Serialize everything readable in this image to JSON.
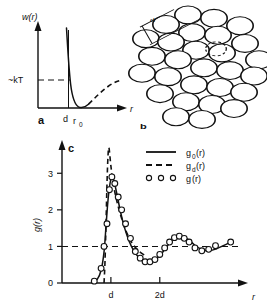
{
  "figure": {
    "background_color": "#ffffff",
    "ink_color": "#111111"
  },
  "panel_a": {
    "letter": "a",
    "ylabel": "w(r)",
    "xlabel": "r",
    "energy_label": "~kT",
    "tick_d": "d",
    "tick_r0": "r",
    "tick_r0_sub": "0",
    "chart_data": {
      "type": "line",
      "title": "Pair potential w(r)",
      "xlabel": "r",
      "ylabel": "w(r)",
      "xlim": [
        0,
        1
      ],
      "ylim": [
        -0.35,
        1.0
      ],
      "grid": false,
      "legend_position": "none",
      "annotations": [
        {
          "text": "~kT",
          "x": 0.0,
          "y": 0.0,
          "note": "thermal energy reference level, dashed guide"
        },
        {
          "text": "d",
          "x": 0.42,
          "y": -0.35,
          "note": "hard core diameter on r axis"
        },
        {
          "text": "r0",
          "x": 0.5,
          "y": -0.35,
          "note": "potential minimum position"
        }
      ],
      "series": [
        {
          "name": "repulsive core and well (solid)",
          "style": "solid",
          "x": [
            0.4,
            0.402,
            0.408,
            0.415,
            0.425,
            0.44,
            0.46,
            0.48,
            0.5,
            0.52,
            0.545
          ],
          "y": [
            1.0,
            0.8,
            0.55,
            0.36,
            0.2,
            0.06,
            -0.06,
            -0.13,
            -0.155,
            -0.15,
            -0.12
          ]
        },
        {
          "name": "attractive tail (dashed)",
          "style": "dashed",
          "x": [
            0.545,
            0.6,
            0.66,
            0.72,
            0.79,
            0.86,
            0.93
          ],
          "y": [
            -0.12,
            -0.065,
            -0.03,
            -0.008,
            0.006,
            0.015,
            0.02
          ]
        }
      ]
    }
  },
  "panel_b": {
    "letter": "b",
    "diameter_label": "d",
    "description": "dense random packing of equal hard discs",
    "circle_count": 28,
    "circle_radius": 13.2,
    "circles": [
      [
        58,
        22
      ],
      [
        84,
        27
      ],
      [
        36,
        36
      ],
      [
        62,
        48
      ],
      [
        88,
        52
      ],
      [
        110,
        38
      ],
      [
        16,
        57
      ],
      [
        41,
        62
      ],
      [
        66,
        74
      ],
      [
        92,
        78
      ],
      [
        115,
        64
      ],
      [
        129,
        88
      ],
      [
        22,
        83
      ],
      [
        48,
        88
      ],
      [
        74,
        100
      ],
      [
        100,
        104
      ],
      [
        124,
        112
      ],
      [
        12,
        108
      ],
      [
        38,
        113
      ],
      [
        64,
        125
      ],
      [
        90,
        129
      ],
      [
        114,
        136
      ],
      [
        30,
        138
      ],
      [
        56,
        150
      ],
      [
        82,
        154
      ],
      [
        104,
        160
      ],
      [
        46,
        172
      ],
      [
        72,
        176
      ]
    ],
    "highlight_circle": [
      86,
      72
    ]
  },
  "panel_c": {
    "letter": "c",
    "ylabel": "g(r)",
    "xlabel": "r",
    "y_ticks": [
      "0",
      "1",
      "2",
      "3"
    ],
    "x_ticks": [
      "d",
      "2d"
    ],
    "legend": [
      {
        "style": "solid",
        "label": "g",
        "sub": "0",
        "suffix": "(r)"
      },
      {
        "style": "dashed",
        "label": "g",
        "sub": "d",
        "suffix": "(r)"
      },
      {
        "style": "circles",
        "label": "g",
        "sub": "",
        "suffix": "(r)"
      },
      {
        "circles_glyph": "o o o"
      }
    ],
    "chart_data": {
      "type": "line",
      "title": "Radial distribution function g(r)",
      "xlabel": "r",
      "ylabel": "g(r)",
      "xlim": [
        0,
        3.6
      ],
      "ylim": [
        0,
        3.8
      ],
      "y_tick_values": [
        0,
        1,
        2,
        3
      ],
      "x_tick_values": [
        1,
        2
      ],
      "x_tick_labels": [
        "d",
        "2d"
      ],
      "grid": false,
      "reference_line_y": 1.0,
      "legend_position": "top-right",
      "series": [
        {
          "name": "g_0(r)",
          "style": "solid",
          "x": [
            0.62,
            0.72,
            0.8,
            0.86,
            0.9,
            0.94,
            0.98,
            1.02,
            1.06,
            1.12,
            1.18,
            1.25,
            1.33,
            1.42,
            1.52,
            1.62,
            1.72,
            1.82,
            1.92,
            2.02,
            2.12,
            2.22,
            2.32,
            2.42,
            2.52,
            2.62,
            2.72,
            2.85,
            3.0,
            3.15,
            3.3,
            3.45
          ],
          "y": [
            0.02,
            0.1,
            0.35,
            0.85,
            1.55,
            2.25,
            2.7,
            2.9,
            2.8,
            2.45,
            2.05,
            1.65,
            1.3,
            1.0,
            0.78,
            0.64,
            0.58,
            0.58,
            0.65,
            0.78,
            0.95,
            1.12,
            1.24,
            1.28,
            1.24,
            1.15,
            1.03,
            0.92,
            0.88,
            0.93,
            1.02,
            1.12
          ]
        },
        {
          "name": "g_d(r)",
          "style": "dashed",
          "description": "hard-sphere reference: zero below d, sharp contact spike at r=d",
          "x": [
            0.86,
            0.88,
            0.9,
            0.92,
            0.94,
            0.96,
            1.0,
            1.05,
            1.12,
            1.2,
            1.3,
            1.42,
            1.55,
            1.7
          ],
          "y": [
            0.0,
            0.6,
            1.6,
            2.7,
            3.45,
            3.7,
            3.2,
            2.7,
            2.25,
            1.85,
            1.45,
            1.12,
            0.9,
            0.75
          ]
        },
        {
          "name": "g(r)",
          "style": "circles",
          "marker": "open-circle",
          "x": [
            0.66,
            0.8,
            0.86,
            0.92,
            0.97,
            1.02,
            1.08,
            1.15,
            1.22,
            1.3,
            1.4,
            1.5,
            1.6,
            1.7,
            1.8,
            1.9,
            2.0,
            2.1,
            2.2,
            2.3,
            2.4,
            2.5,
            2.6,
            2.72,
            2.86,
            3.0,
            3.14,
            3.45
          ],
          "y": [
            0.05,
            0.4,
            1.0,
            1.62,
            2.55,
            2.9,
            2.72,
            2.35,
            2.0,
            1.62,
            1.22,
            0.86,
            0.68,
            0.58,
            0.58,
            0.64,
            0.78,
            0.96,
            1.12,
            1.24,
            1.28,
            1.22,
            1.12,
            0.96,
            0.88,
            0.92,
            1.02,
            1.12
          ]
        }
      ]
    }
  }
}
